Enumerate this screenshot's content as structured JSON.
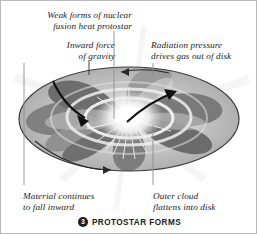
{
  "figure": {
    "title": "PROTOSTAR FORMS",
    "step_number": "3",
    "background_color": "#ffffff",
    "border_color": "#b9b9b9",
    "ink_color": "#1a1a1a",
    "leader_line_color": "#8d8d8d"
  },
  "annotations": [
    {
      "key": "fusion",
      "name": "annotation-weak-fusion",
      "line1": "Weak forms of nuclear",
      "line2": "fusion heat protostar"
    },
    {
      "key": "gravity",
      "name": "annotation-inward-gravity",
      "line1": "Inward force",
      "line2": "of gravity"
    },
    {
      "key": "radiation",
      "name": "annotation-radiation-pressure",
      "line1": "Radiation pressure",
      "line2": "drives gas out of disk"
    },
    {
      "key": "material",
      "name": "annotation-material-infall",
      "line1": "Material continues",
      "line2": "to fall inward"
    },
    {
      "key": "outercloud",
      "name": "annotation-outer-cloud",
      "line1": "Outer cloud",
      "line2": "flattens into disk"
    }
  ],
  "diagram": {
    "type": "protostar-accretion-disk",
    "center_glow_color": "#ffffff",
    "disk_light_gray": "#d3d3d3",
    "disk_mid_gray": "#b4b4b4",
    "disk_dark_gray": "#6f6f6f",
    "disk_outline_color": "#3b3b3b",
    "arrows": [
      {
        "name": "infall-arrow-left",
        "description": "curved arrow sweeping inward toward protostar"
      },
      {
        "name": "outflow-arrow-right",
        "description": "curved arrow sweeping outward from protostar"
      },
      {
        "name": "rotation-arrow-bottom",
        "description": "arrow along lower disk rim indicating rotation"
      },
      {
        "name": "rotation-arrow-top",
        "description": "arrow along upper disk rim indicating rotation"
      }
    ]
  }
}
